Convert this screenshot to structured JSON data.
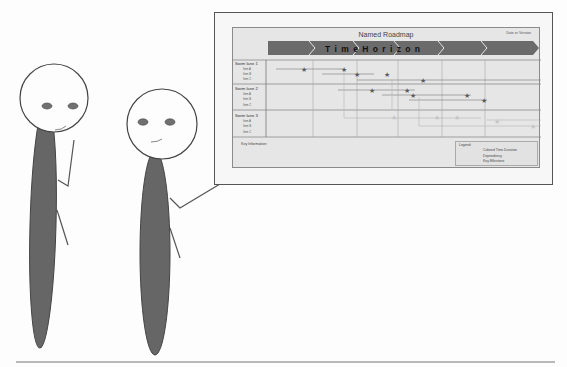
{
  "roadmap": {
    "title": "Named Roadmap",
    "date_label": "Date or Version",
    "time_horizon_label": "T i m e   H o r i z o n",
    "time_segments": 6,
    "swim_lanes": [
      {
        "label": "Swim lane 1",
        "items": [
          "Item A",
          "Item B",
          "Item C"
        ]
      },
      {
        "label": "Swim lane 2",
        "items": [
          "Item A",
          "Item B",
          "Item C"
        ]
      },
      {
        "label": "Swim lane 3",
        "items": [
          "Item A",
          "Item B",
          "Item C"
        ]
      }
    ],
    "key_information_label": "Key Information:",
    "legend": {
      "title": "Legend:",
      "items": [
        {
          "label": "Colored Time Duration",
          "symbol": "solid-line"
        },
        {
          "label": "Dependency",
          "symbol": "dashed-line"
        },
        {
          "label": "Key Milestone",
          "symbol": "star-icon"
        }
      ]
    }
  },
  "colors": {
    "arrow_fill": "#6b6b6b",
    "milestone_star": "#5a5a5a",
    "faded_star": "#c4c4c4",
    "figure_body": "#666666",
    "figure_eyes": "#707070"
  },
  "figures": [
    {
      "name": "left-person",
      "pose": "hand-on-chin"
    },
    {
      "name": "right-person",
      "pose": "pointing-at-roadmap"
    }
  ]
}
